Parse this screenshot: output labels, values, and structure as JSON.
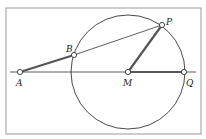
{
  "diagram": {
    "points": {
      "A": {
        "label": "A",
        "x": 20,
        "y": 72
      },
      "B": {
        "label": "B",
        "x": 74,
        "y": 55
      },
      "P": {
        "label": "P",
        "x": 162,
        "y": 25
      },
      "M": {
        "label": "M",
        "x": 128,
        "y": 72
      },
      "Q": {
        "label": "Q",
        "x": 184,
        "y": 72
      }
    },
    "circle": {
      "center": "M",
      "radius": 57
    },
    "colors": {
      "line": "#222222",
      "thick": "#555555",
      "frame": "#999999",
      "background": "#ffffff"
    }
  }
}
